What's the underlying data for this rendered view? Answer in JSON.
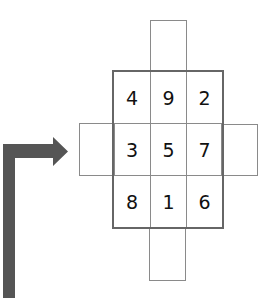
{
  "diagram": {
    "title": "",
    "grid": [
      [
        "4",
        "9",
        "2"
      ],
      [
        "3",
        "5",
        "7"
      ],
      [
        "8",
        "1",
        "6"
      ]
    ],
    "extension_boxes": [
      "top",
      "left",
      "right",
      "bottom"
    ],
    "arrow": {
      "direction": "up-then-right",
      "color": "#555555"
    }
  }
}
